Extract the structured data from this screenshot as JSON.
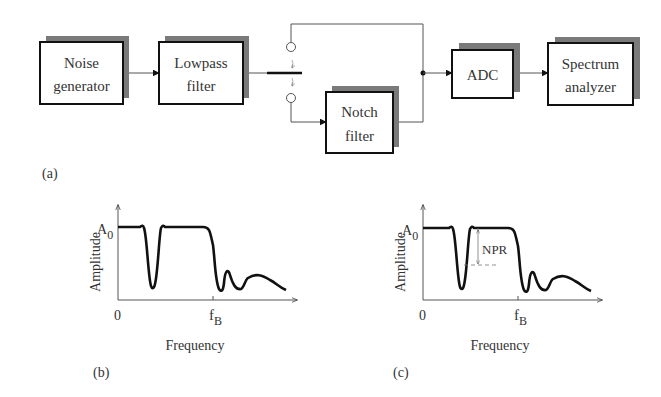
{
  "block_diagram": {
    "label": "(a)",
    "blocks": [
      {
        "id": "noise",
        "line1": "Noise",
        "line2": "generator"
      },
      {
        "id": "lowpass",
        "line1": "Lowpass",
        "line2": "filter"
      },
      {
        "id": "notch",
        "line1": "Notch",
        "line2": "filter"
      },
      {
        "id": "adc",
        "line1": "ADC",
        "line2": ""
      },
      {
        "id": "spectrum",
        "line1": "Spectrum",
        "line2": "analyzer"
      }
    ],
    "switch": {
      "positions": [
        "bypass",
        "notch filter"
      ]
    }
  },
  "plots": [
    {
      "label": "(b)",
      "ylabel": "Amplitude",
      "xlabel": "Frequency",
      "y_level": "A",
      "y_level_sub": "0",
      "x_origin": "0",
      "x_mark": "f",
      "x_mark_sub": "B"
    },
    {
      "label": "(c)",
      "ylabel": "Amplitude",
      "xlabel": "Frequency",
      "y_level": "A",
      "y_level_sub": "0",
      "x_origin": "0",
      "x_mark": "f",
      "x_mark_sub": "B",
      "annotation": "NPR"
    }
  ],
  "colors": {
    "line": "#111111",
    "shadow": "#7a7a7a",
    "wire": "#555555",
    "text": "#333333"
  }
}
